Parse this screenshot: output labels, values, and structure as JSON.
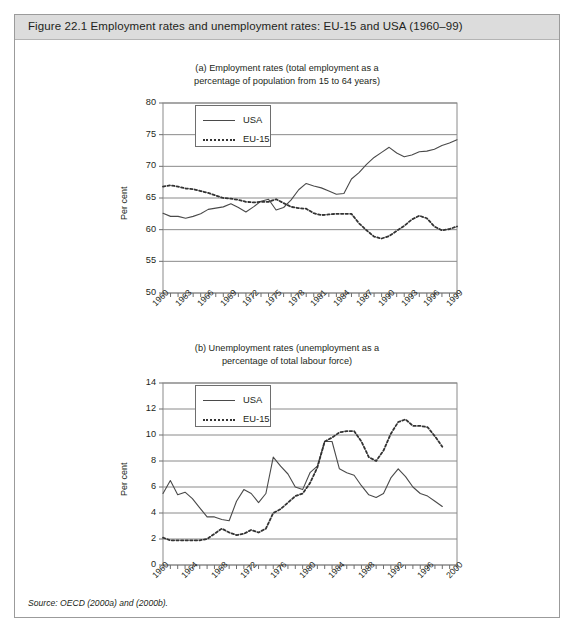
{
  "figure": {
    "title": "Figure 22.1  Employment rates and unemployment rates: EU-15 and USA (1960–99)",
    "source": "Source: OECD (2000a) and (2000b).",
    "header_bg": "#dcdcdc",
    "border_color": "#9b9b9b",
    "usa_color": "#4a4a4a",
    "eu_color": "#333333",
    "grid_color": "#8a8a8a"
  },
  "panel_a": {
    "subtitle_line1": "(a) Employment rates (total employment as a",
    "subtitle_line2": "percentage of population from 15 to 64 years)",
    "ylabel": "Per cent",
    "legend": {
      "usa": "USA",
      "eu": "EU-15"
    }
  },
  "panel_b": {
    "subtitle_line1": "(b) Unemployment rates (unemployment as a",
    "subtitle_line2": "percentage of total labour force)",
    "ylabel": "Per cent",
    "legend": {
      "usa": "USA",
      "eu": "EU-15"
    }
  },
  "chart_data": [
    {
      "id": "panel-a",
      "type": "line",
      "title": "(a) Employment rates (total employment as a percentage of population from 15 to 64 years)",
      "xlabel": "",
      "ylabel": "Per cent",
      "ylim": [
        50,
        80
      ],
      "yticks": [
        50,
        55,
        60,
        65,
        70,
        75,
        80
      ],
      "xlim": [
        1960,
        1999
      ],
      "xticks": [
        1960,
        1963,
        1966,
        1969,
        1972,
        1975,
        1978,
        1981,
        1984,
        1987,
        1990,
        1993,
        1996,
        1999
      ],
      "xtick_labels": [
        "1960",
        "1963",
        "1966",
        "1969",
        "1972",
        "1975",
        "1978",
        "1981",
        "1984",
        "1987",
        "1990",
        "1993",
        "1996",
        "1999"
      ],
      "minor_xticks_every": 1,
      "grid": true,
      "legend_position": "upper-left",
      "x": [
        1960,
        1961,
        1962,
        1963,
        1964,
        1965,
        1966,
        1967,
        1968,
        1969,
        1970,
        1971,
        1972,
        1973,
        1974,
        1975,
        1976,
        1977,
        1978,
        1979,
        1980,
        1981,
        1982,
        1983,
        1984,
        1985,
        1986,
        1987,
        1988,
        1989,
        1990,
        1991,
        1992,
        1993,
        1994,
        1995,
        1996,
        1997,
        1998,
        1999
      ],
      "series": [
        {
          "name": "USA",
          "style": "solid",
          "color": "#4a4a4a",
          "values": [
            62.6,
            62.1,
            62.1,
            61.8,
            62.1,
            62.5,
            63.2,
            63.4,
            63.6,
            64.1,
            63.5,
            62.8,
            63.6,
            64.5,
            64.8,
            63.1,
            63.5,
            64.7,
            66.3,
            67.3,
            66.9,
            66.6,
            66.1,
            65.6,
            65.7,
            68.0,
            69.0,
            70.3,
            71.4,
            72.2,
            73.0,
            72.1,
            71.5,
            71.8,
            72.3,
            72.4,
            72.7,
            73.3,
            73.7,
            74.2
          ]
        },
        {
          "name": "EU-15",
          "style": "dotted",
          "color": "#333333",
          "values": [
            66.8,
            67.0,
            66.8,
            66.5,
            66.4,
            66.1,
            65.8,
            65.4,
            65.0,
            64.9,
            64.7,
            64.4,
            64.3,
            64.4,
            64.4,
            64.8,
            64.2,
            63.6,
            63.4,
            63.3,
            62.6,
            62.3,
            62.4,
            62.5,
            62.5,
            62.5,
            61.0,
            59.9,
            58.9,
            58.6,
            59.0,
            59.8,
            60.6,
            61.6,
            62.2,
            61.8,
            60.5,
            59.9,
            60.1,
            60.5
          ]
        }
      ]
    },
    {
      "id": "panel-b",
      "type": "line",
      "title": "(b) Unemployment rates (unemployment as a percentage of total labour force)",
      "xlabel": "",
      "ylabel": "Per cent",
      "ylim": [
        0,
        14
      ],
      "yticks": [
        0,
        2,
        4,
        6,
        8,
        10,
        12,
        14
      ],
      "xlim": [
        1960,
        2000
      ],
      "xticks": [
        1960,
        1964,
        1968,
        1972,
        1976,
        1980,
        1984,
        1988,
        1992,
        1996,
        2000
      ],
      "xtick_labels": [
        "1960",
        "1964",
        "1968",
        "1972",
        "1976",
        "1980",
        "1984",
        "1988",
        "1992",
        "1996",
        "2000"
      ],
      "minor_xticks_every": 1,
      "grid": true,
      "legend_position": "upper-left",
      "x": [
        1960,
        1961,
        1962,
        1963,
        1964,
        1965,
        1966,
        1967,
        1968,
        1969,
        1970,
        1971,
        1972,
        1973,
        1974,
        1975,
        1976,
        1977,
        1978,
        1979,
        1980,
        1981,
        1982,
        1983,
        1984,
        1985,
        1986,
        1987,
        1988,
        1989,
        1990,
        1991,
        1992,
        1993,
        1994,
        1995,
        1996,
        1997,
        1998,
        1999,
        2000
      ],
      "series": [
        {
          "name": "USA",
          "style": "solid",
          "color": "#4a4a4a",
          "values": [
            5.5,
            6.5,
            5.4,
            5.6,
            5.1,
            4.4,
            3.7,
            3.7,
            3.5,
            3.4,
            4.9,
            5.8,
            5.5,
            4.8,
            5.5,
            8.3,
            7.6,
            7.0,
            6.0,
            5.8,
            7.1,
            7.6,
            9.5,
            9.5,
            7.4,
            7.1,
            6.9,
            6.1,
            5.4,
            5.2,
            5.5,
            6.7,
            7.4,
            6.8,
            6.0,
            5.5,
            5.3,
            4.9,
            4.5
          ]
        },
        {
          "name": "EU-15",
          "style": "dotted",
          "color": "#333333",
          "values": [
            2.1,
            1.9,
            1.9,
            1.9,
            1.9,
            1.9,
            2.0,
            2.4,
            2.8,
            2.5,
            2.3,
            2.4,
            2.7,
            2.5,
            2.8,
            4.0,
            4.3,
            4.8,
            5.3,
            5.5,
            6.3,
            7.5,
            9.5,
            9.8,
            10.2,
            10.3,
            10.3,
            9.5,
            8.3,
            8.0,
            8.8,
            10.1,
            11.0,
            11.2,
            10.7,
            10.7,
            10.6,
            9.9,
            9.1
          ]
        }
      ]
    }
  ]
}
